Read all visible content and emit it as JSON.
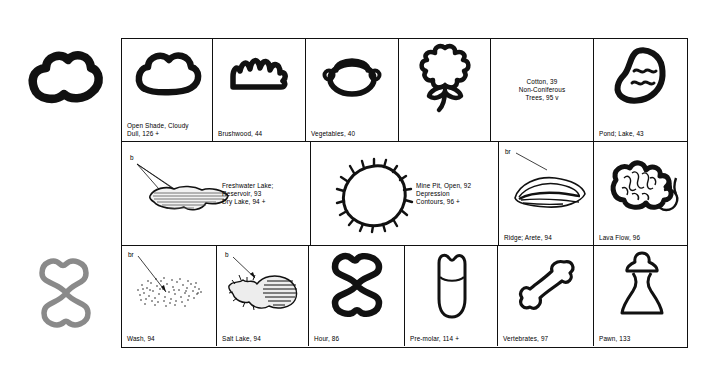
{
  "margin_keys": [
    {
      "name": "cloud",
      "color": "#111111",
      "label": ""
    },
    {
      "name": "hourglass",
      "color": "#8a8a8a",
      "label": ""
    }
  ],
  "table": {
    "rows": [
      {
        "row": 1,
        "cells": [
          {
            "id": "open-shade",
            "icon": "cloud",
            "label": "Open Shade, Cloudy\n   Dull, 126 +",
            "type": "art"
          },
          {
            "id": "brushwood",
            "icon": "brushwood",
            "label": "Brushwood, 44",
            "type": "art"
          },
          {
            "id": "vegetables",
            "icon": "vegetables",
            "label": "Vegetables, 40",
            "type": "art"
          },
          {
            "id": "cotton",
            "icon": "cotton",
            "label": "",
            "type": "art"
          },
          {
            "id": "cotton-text",
            "icon": "",
            "label": "Cotton, 39\nNon-Coniferous\nTrees, 95 v",
            "type": "text"
          },
          {
            "id": "pond-lake",
            "icon": "pond",
            "label": "Pond; Lake, 43",
            "type": "art"
          }
        ]
      },
      {
        "row": 2,
        "cells": [
          {
            "id": "freshwater-lake",
            "icon": "hatched-lake",
            "label": "Freshwater Lake;\n   Reservoir, 93\nDry Lake, 94 +",
            "type": "art-text",
            "tag": "b"
          },
          {
            "id": "mine-pit",
            "icon": "depression",
            "label": "Mine Pit, Open, 92\nDepression\n   Contours, 96 +",
            "type": "art-text"
          },
          {
            "id": "ridge-arete",
            "icon": "ridge",
            "label": "Ridge; Arete, 94",
            "type": "art",
            "tag": "br"
          },
          {
            "id": "lava-flow",
            "icon": "lava",
            "label": "Lava Flow, 96",
            "type": "art"
          }
        ]
      },
      {
        "row": 3,
        "cells": [
          {
            "id": "wash",
            "icon": "stipple-wash",
            "label": "Wash, 94",
            "type": "art",
            "tag": "br"
          },
          {
            "id": "salt-lake",
            "icon": "salt-lake",
            "label": "Salt Lake, 94",
            "type": "art",
            "tag": "b"
          },
          {
            "id": "hour",
            "icon": "hourglass",
            "label": "Hour, 86",
            "type": "art"
          },
          {
            "id": "pre-molar",
            "icon": "premolar",
            "label": "Pre-molar, 114 +",
            "type": "art"
          },
          {
            "id": "vertebrates",
            "icon": "bone",
            "label": "Vertebrates, 97",
            "type": "art"
          },
          {
            "id": "pawn",
            "icon": "pawn",
            "label": "Pawn, 133",
            "type": "art"
          }
        ]
      }
    ]
  },
  "colors": {
    "ink": "#111111",
    "gray_key": "#8a8a8a",
    "background": "#ffffff"
  }
}
